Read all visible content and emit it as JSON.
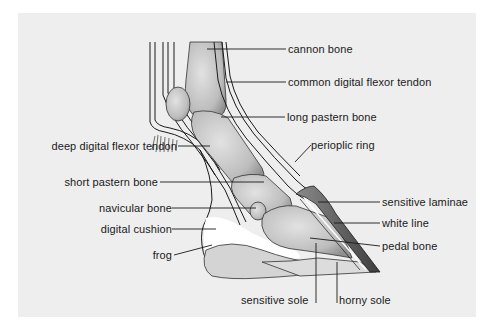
{
  "diagram": {
    "colors": {
      "panel": "#eeeeee",
      "bone": "#c9c9c9",
      "bone_shade": "#9a9a9a",
      "hoof_wall": "#555555",
      "sole": "#d6d6d6",
      "cushion": "#ffffff",
      "line": "#1a1a1a"
    },
    "labels": {
      "cannon_bone": "cannon bone",
      "common_digital_flexor_tendon": "common digital flexor tendon",
      "long_pastern_bone": "long pastern bone",
      "deep_digital_flexor_tendon": "deep digital flexor tendon",
      "perioplic_ring": "perioplic ring",
      "short_pastern_bone": "short pastern bone",
      "sensitive_laminae": "sensitive laminae",
      "navicular_bone": "navicular bone",
      "white_line": "white line",
      "digital_cushion": "digital cushion",
      "pedal_bone": "pedal bone",
      "frog": "frog",
      "sensitive_sole": "sensitive sole",
      "horny_sole": "horny sole"
    }
  }
}
